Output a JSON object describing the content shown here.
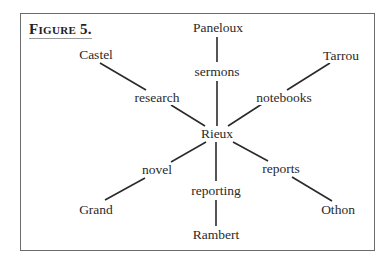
{
  "figure": {
    "title": "Figure 5.",
    "center": {
      "id": "rieux",
      "label": "Rieux",
      "x": 217,
      "y": 134
    },
    "nodes": [
      {
        "id": "paneloux",
        "label": "Paneloux",
        "x": 218,
        "y": 28
      },
      {
        "id": "sermons",
        "label": "sermons",
        "x": 217,
        "y": 72
      },
      {
        "id": "castel",
        "label": "Castel",
        "x": 96,
        "y": 55
      },
      {
        "id": "research",
        "label": "research",
        "x": 157,
        "y": 98
      },
      {
        "id": "tarrou",
        "label": "Tarrou",
        "x": 341,
        "y": 56
      },
      {
        "id": "notebooks",
        "label": "notebooks",
        "x": 284,
        "y": 98
      },
      {
        "id": "novel",
        "label": "novel",
        "x": 157,
        "y": 170
      },
      {
        "id": "grand",
        "label": "Grand",
        "x": 96,
        "y": 210
      },
      {
        "id": "reporting",
        "label": "reporting",
        "x": 216,
        "y": 191
      },
      {
        "id": "rambert",
        "label": "Rambert",
        "x": 216,
        "y": 235
      },
      {
        "id": "reports",
        "label": "reports",
        "x": 281,
        "y": 169
      },
      {
        "id": "othon",
        "label": "Othon",
        "x": 338,
        "y": 210
      }
    ],
    "edges": [
      {
        "x1": 217,
        "y1": 37,
        "x2": 217,
        "y2": 62
      },
      {
        "x1": 217,
        "y1": 81,
        "x2": 217,
        "y2": 126
      },
      {
        "x1": 100,
        "y1": 63,
        "x2": 146,
        "y2": 90
      },
      {
        "x1": 171,
        "y1": 105,
        "x2": 205,
        "y2": 126
      },
      {
        "x1": 330,
        "y1": 63,
        "x2": 287,
        "y2": 90
      },
      {
        "x1": 262,
        "y1": 104,
        "x2": 228,
        "y2": 126
      },
      {
        "x1": 206,
        "y1": 142,
        "x2": 171,
        "y2": 162
      },
      {
        "x1": 145,
        "y1": 178,
        "x2": 105,
        "y2": 200
      },
      {
        "x1": 216,
        "y1": 142,
        "x2": 216,
        "y2": 181
      },
      {
        "x1": 216,
        "y1": 200,
        "x2": 216,
        "y2": 226
      },
      {
        "x1": 233,
        "y1": 142,
        "x2": 268,
        "y2": 161
      },
      {
        "x1": 292,
        "y1": 177,
        "x2": 332,
        "y2": 201
      }
    ]
  }
}
